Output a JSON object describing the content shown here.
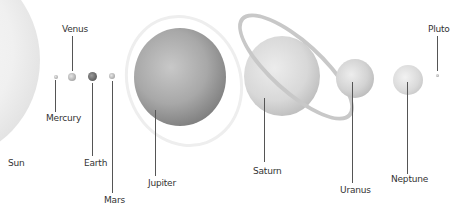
{
  "diagram": {
    "type": "solar-system-planet-size-comparison",
    "bodies": [
      {
        "name": "Sun"
      },
      {
        "name": "Mercury"
      },
      {
        "name": "Venus"
      },
      {
        "name": "Earth"
      },
      {
        "name": "Mars"
      },
      {
        "name": "Jupiter"
      },
      {
        "name": "Saturn"
      },
      {
        "name": "Uranus"
      },
      {
        "name": "Neptune"
      },
      {
        "name": "Pluto"
      }
    ]
  }
}
